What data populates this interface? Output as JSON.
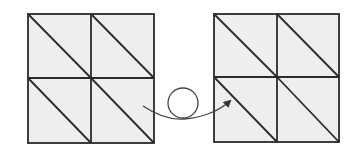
{
  "diagram": {
    "colors": {
      "fill": "#eeeeee",
      "stroke": "#2a2a2a",
      "arrow": "#444444",
      "background": "#ffffff"
    },
    "grids": [
      {
        "id": "left",
        "x": 28,
        "y": 14,
        "size": 126,
        "rows": 2,
        "cols": 2,
        "diagonal": "top-left-to-bottom-right"
      },
      {
        "id": "right",
        "x": 214,
        "y": 14,
        "size": 126,
        "rows": 2,
        "cols": 2,
        "diagonal": "top-left-to-bottom-right"
      }
    ],
    "connector": {
      "type": "loop-arrow",
      "from": [
        143,
        107
      ],
      "loop_center": [
        183,
        102
      ],
      "loop_radius": 15,
      "to": [
        230,
        102
      ]
    }
  }
}
